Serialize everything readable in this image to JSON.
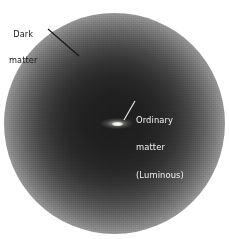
{
  "figure": {
    "background_color": "#ffffff",
    "width": 229,
    "height": 239
  },
  "halo": {
    "name": "dark-matter-halo",
    "center_color": "#1d1d1d",
    "edge_color": "#ffffff",
    "center_x": 114,
    "center_y": 123,
    "radius": 110
  },
  "galaxy": {
    "name": "luminous-galaxy-disk",
    "color": "#fdfdf6",
    "center_x": 117,
    "center_y": 123,
    "width": 32,
    "height": 11
  },
  "annotations": [
    {
      "id": "dark-matter",
      "lines": [
        "Dark",
        "matter"
      ],
      "line1": "Dark",
      "line2": "matter",
      "text_color": "#181818",
      "leader": {
        "x1": 48,
        "y1": 29,
        "x2": 79,
        "y2": 56
      }
    },
    {
      "id": "ordinary-matter",
      "lines": [
        "Ordinary",
        "matter",
        "(Luminous)"
      ],
      "line1": "Ordinary",
      "line2": "matter",
      "line3": "(Luminous)",
      "text_color": "#f2f2ef",
      "leader": {
        "x1": 135,
        "y1": 101,
        "x2": 124,
        "y2": 120
      }
    }
  ]
}
